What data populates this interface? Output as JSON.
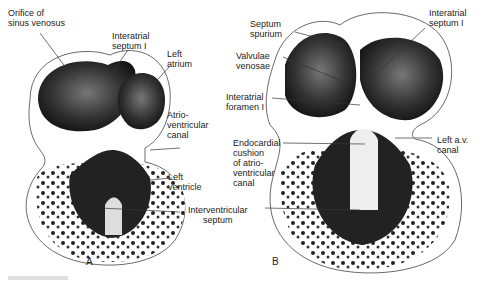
{
  "figure": {
    "panels": [
      {
        "id": "A",
        "letter": "A",
        "labels": {
          "orifice": "Orifice of\nsinus venosus",
          "interatrial_septum": "Interatrial\nseptum I",
          "left_atrium": "Left\natrium",
          "av_canal": "Atrio-\nventricular\ncanal",
          "left_ventricle": "Left\nventricle"
        }
      },
      {
        "id": "B",
        "letter": "B",
        "labels": {
          "septum_spurium": "Septum\nspurium",
          "interatrial_septum": "Interatrial\nseptum I",
          "valvulae": "Valvulae\nvenosae",
          "foramen": "Interatrial\nforamen I",
          "left_av_canal": "Left a.v.\ncanal",
          "endocardial": "Endocardial\ncushion\nof atrio-\nventricular\ncanal"
        }
      }
    ],
    "shared_label": "Interventricular\nseptum"
  }
}
